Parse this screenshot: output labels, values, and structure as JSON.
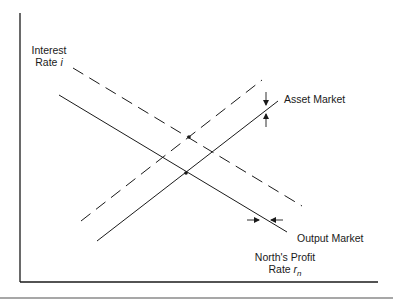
{
  "diagram": {
    "y_axis_label_line1": "Interest",
    "y_axis_label_line2": "Rate",
    "y_axis_symbol": "i",
    "x_axis_label_line1": "North's Profit",
    "x_axis_label_line2": "Rate",
    "x_axis_symbol": "r",
    "x_axis_subscript": "n",
    "curves": [
      {
        "name": "Asset Market",
        "style": "solid",
        "slope": "upward"
      },
      {
        "name": "Asset Market (shifted)",
        "style": "dashed",
        "slope": "upward"
      },
      {
        "name": "Output Market",
        "style": "solid",
        "slope": "downward"
      },
      {
        "name": "Output Market (shifted)",
        "style": "dashed",
        "slope": "downward"
      }
    ],
    "asset_market_label": "Asset Market",
    "output_market_label": "Output Market",
    "equilibria": [
      {
        "type": "original",
        "x": 186,
        "y": 173
      },
      {
        "type": "shifted",
        "x": 189,
        "y": 137
      }
    ],
    "colors": {
      "line": "#1a1a1a",
      "rule": "#8a8a8a"
    }
  }
}
